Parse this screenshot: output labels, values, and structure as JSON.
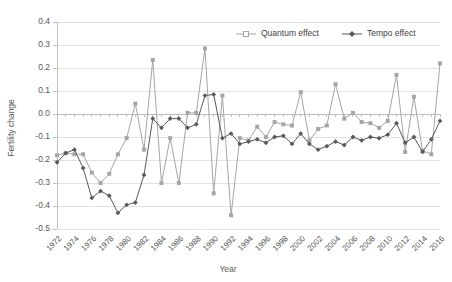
{
  "chart_data": {
    "type": "line",
    "title": "",
    "xlabel": "Year",
    "ylabel": "Fertility change",
    "xlim": [
      1972,
      2016
    ],
    "ylim": [
      -0.5,
      0.4
    ],
    "ytick_step": 0.1,
    "grid": true,
    "legend_position": "top-right",
    "x": [
      1972,
      1973,
      1974,
      1975,
      1976,
      1977,
      1978,
      1979,
      1980,
      1981,
      1982,
      1983,
      1984,
      1985,
      1986,
      1987,
      1988,
      1989,
      1990,
      1991,
      1992,
      1993,
      1994,
      1995,
      1996,
      1997,
      1998,
      1999,
      2000,
      2001,
      2002,
      2003,
      2004,
      2005,
      2006,
      2007,
      2008,
      2009,
      2010,
      2011,
      2012,
      2013,
      2014,
      2015,
      2016
    ],
    "xticks": [
      "1972",
      "1974",
      "1976",
      "1978",
      "1980",
      "1982",
      "1984",
      "1986",
      "1988",
      "1990",
      "1992",
      "1994",
      "1996",
      "1998",
      "2000",
      "2002",
      "2004",
      "2006",
      "2008",
      "2010",
      "2012",
      "2014",
      "2016"
    ],
    "yticks": [
      "0.4",
      "0.3",
      "0.2",
      "0.1",
      "0.0",
      "-0.1",
      "-0.2",
      "-0.3",
      "-0.4",
      "-0.5"
    ],
    "series": [
      {
        "name": "Quantum effect",
        "color": "#a6a6a6",
        "marker": "square",
        "values": [
          -0.18,
          -0.17,
          -0.175,
          -0.175,
          -0.255,
          -0.3,
          -0.26,
          -0.175,
          -0.105,
          0.045,
          -0.155,
          0.235,
          -0.3,
          -0.105,
          -0.3,
          0.005,
          0.005,
          0.285,
          -0.345,
          0.08,
          -0.44,
          -0.105,
          -0.115,
          -0.055,
          -0.1,
          -0.035,
          -0.045,
          -0.05,
          0.095,
          -0.115,
          -0.065,
          -0.05,
          0.13,
          -0.02,
          0.005,
          -0.035,
          -0.04,
          -0.06,
          -0.03,
          0.17,
          -0.165,
          0.075,
          -0.16,
          -0.175,
          0.22
        ]
      },
      {
        "name": "Tempo effect",
        "color": "#595959",
        "marker": "diamond",
        "values": [
          -0.21,
          -0.17,
          -0.155,
          -0.235,
          -0.365,
          -0.335,
          -0.355,
          -0.43,
          -0.395,
          -0.385,
          -0.265,
          -0.02,
          -0.06,
          -0.02,
          -0.02,
          -0.06,
          -0.045,
          0.08,
          0.085,
          -0.105,
          -0.085,
          -0.13,
          -0.12,
          -0.11,
          -0.125,
          -0.1,
          -0.095,
          -0.13,
          -0.085,
          -0.13,
          -0.155,
          -0.14,
          -0.12,
          -0.135,
          -0.1,
          -0.115,
          -0.1,
          -0.105,
          -0.09,
          -0.04,
          -0.125,
          -0.1,
          -0.165,
          -0.11,
          -0.03
        ]
      }
    ]
  },
  "legend": {
    "items": [
      {
        "label": "Quantum effect"
      },
      {
        "label": "Tempo effect"
      }
    ]
  },
  "axes": {
    "y_title": "Fertility change",
    "x_title": "Year"
  }
}
